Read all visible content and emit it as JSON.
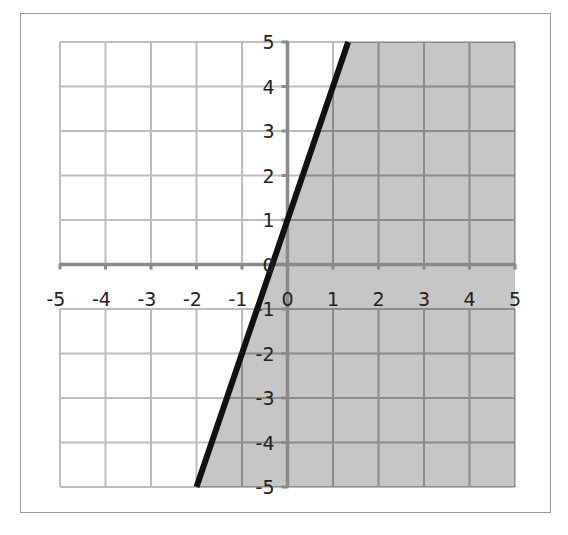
{
  "chart_data": {
    "type": "line",
    "title": "",
    "xlabel": "",
    "ylabel": "",
    "xlim": [
      -5,
      5
    ],
    "ylim": [
      -5,
      5
    ],
    "grid": true,
    "legend": null,
    "x_ticks": [
      "-5",
      "-4",
      "-3",
      "-2",
      "-1",
      "0",
      "1",
      "2",
      "3",
      "4",
      "5"
    ],
    "y_ticks": [
      "5",
      "4",
      "3",
      "2",
      "1",
      "0",
      "-1",
      "-2",
      "-3",
      "-4",
      "-5"
    ],
    "series": [
      {
        "name": "boundary line y = 3x + 1",
        "style": "solid",
        "x": [
          -2,
          1.333
        ],
        "y": [
          -5,
          5
        ]
      }
    ],
    "shaded_region": {
      "inequality": "y <= 3x + 1",
      "side": "right/below the line",
      "polygon": [
        [
          -2,
          -5
        ],
        [
          1.333,
          5
        ],
        [
          5,
          5
        ],
        [
          5,
          -5
        ]
      ]
    },
    "colors": {
      "grid": "#bdbdbd",
      "grid_on_shade": "#8c8c8c",
      "axis": "#8a8a8a",
      "shade": "#c6c6c6",
      "line": "#111111",
      "frame": "#9a9a9a"
    }
  }
}
